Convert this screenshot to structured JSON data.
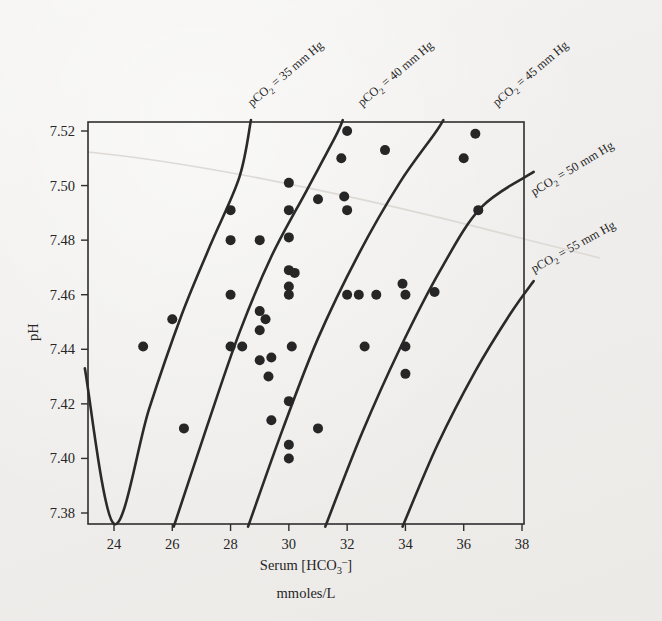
{
  "figure": {
    "background_color": "#f1efec",
    "ink_color": "#262626",
    "crease_color": "#ddd9d4"
  },
  "axes": {
    "x_title_line1": "Serum [HCO",
    "x_title_sub": "3",
    "x_title_sup": "–",
    "x_title_close": "]",
    "x_title_full": "Serum [HCO₃⁻]",
    "x_title_line2": "mmoles/L",
    "y_title": "pH",
    "x_ticks": [
      "24",
      "26",
      "28",
      "30",
      "32",
      "34",
      "36",
      "38"
    ],
    "y_ticks": [
      "7.38",
      "7.40",
      "7.42",
      "7.44",
      "7.46",
      "7.48",
      "7.50",
      "7.52"
    ]
  },
  "isopleths": [
    {
      "label_prefix": "pCO",
      "label_sub": "2",
      "label_suffix": " = 35 mm Hg",
      "value": 35,
      "label_text": "pCO₂ = 35 mm Hg"
    },
    {
      "label_prefix": "pCO",
      "label_sub": "2",
      "label_suffix": " = 40 mm Hg",
      "value": 40,
      "label_text": "pCO₂ = 40 mm Hg"
    },
    {
      "label_prefix": "pCO",
      "label_sub": "2",
      "label_suffix": " = 45 mm Hg",
      "value": 45,
      "label_text": "pCO₂ = 45 mm Hg"
    },
    {
      "label_prefix": "pCO",
      "label_sub": "2",
      "label_suffix": " = 50 mm Hg",
      "value": 50,
      "label_text": "pCO₂ = 50 mm Hg"
    },
    {
      "label_prefix": "pCO",
      "label_sub": "2",
      "label_suffix": " = 55 mm Hg",
      "value": 55,
      "label_text": "pCO₂ = 55 mm Hg"
    }
  ],
  "chart_data": {
    "type": "scatter",
    "title": "",
    "xlabel": "Serum [HCO₃⁻] mmoles/L",
    "ylabel": "pH",
    "xlim": [
      23,
      38.4
    ],
    "ylim": [
      7.371,
      7.525
    ],
    "grid": false,
    "legend": "none",
    "x_tick_values": [
      24,
      26,
      28,
      30,
      32,
      34,
      36,
      38
    ],
    "y_tick_values": [
      7.38,
      7.4,
      7.42,
      7.44,
      7.46,
      7.48,
      7.5,
      7.52
    ],
    "points": [
      [
        25.0,
        7.441
      ],
      [
        26.0,
        7.451
      ],
      [
        26.4,
        7.411
      ],
      [
        28.0,
        7.491
      ],
      [
        28.0,
        7.48
      ],
      [
        28.0,
        7.46
      ],
      [
        28.0,
        7.441
      ],
      [
        28.4,
        7.441
      ],
      [
        29.0,
        7.48
      ],
      [
        29.0,
        7.454
      ],
      [
        29.2,
        7.451
      ],
      [
        29.0,
        7.447
      ],
      [
        29.0,
        7.436
      ],
      [
        29.3,
        7.43
      ],
      [
        29.4,
        7.437
      ],
      [
        29.4,
        7.414
      ],
      [
        30.0,
        7.501
      ],
      [
        30.0,
        7.491
      ],
      [
        30.0,
        7.481
      ],
      [
        30.0,
        7.469
      ],
      [
        30.2,
        7.468
      ],
      [
        30.0,
        7.463
      ],
      [
        30.0,
        7.46
      ],
      [
        30.1,
        7.441
      ],
      [
        30.0,
        7.421
      ],
      [
        30.0,
        7.405
      ],
      [
        30.0,
        7.4
      ],
      [
        31.0,
        7.495
      ],
      [
        31.0,
        7.411
      ],
      [
        31.8,
        7.51
      ],
      [
        31.9,
        7.496
      ],
      [
        32.0,
        7.52
      ],
      [
        32.0,
        7.491
      ],
      [
        32.0,
        7.46
      ],
      [
        32.4,
        7.46
      ],
      [
        32.6,
        7.441
      ],
      [
        33.0,
        7.46
      ],
      [
        33.3,
        7.513
      ],
      [
        33.9,
        7.464
      ],
      [
        34.0,
        7.46
      ],
      [
        34.0,
        7.441
      ],
      [
        34.0,
        7.431
      ],
      [
        35.0,
        7.461
      ],
      [
        36.0,
        7.51
      ],
      [
        36.4,
        7.519
      ],
      [
        36.5,
        7.491
      ]
    ],
    "isopleth_curves": [
      {
        "name": "pCO2 = 35 mm Hg",
        "value": 35,
        "path_points": [
          [
            23.0,
            7.433
          ],
          [
            24.0,
            7.376
          ],
          [
            25.2,
            7.418
          ],
          [
            26.3,
            7.452
          ],
          [
            27.3,
            7.478
          ],
          [
            28.3,
            7.503
          ],
          [
            28.7,
            7.524
          ]
        ]
      },
      {
        "name": "pCO2 = 40 mm Hg",
        "value": 40,
        "path_points": [
          [
            26.05,
            7.375
          ],
          [
            27.2,
            7.412
          ],
          [
            28.3,
            7.446
          ],
          [
            29.4,
            7.474
          ],
          [
            30.6,
            7.498
          ],
          [
            31.6,
            7.518
          ],
          [
            31.85,
            7.524
          ]
        ]
      },
      {
        "name": "pCO2 = 45 mm Hg",
        "value": 45,
        "path_points": [
          [
            28.6,
            7.375
          ],
          [
            29.8,
            7.411
          ],
          [
            31.0,
            7.444
          ],
          [
            32.4,
            7.475
          ],
          [
            33.8,
            7.501
          ],
          [
            35.0,
            7.519
          ],
          [
            35.3,
            7.524
          ]
        ]
      },
      {
        "name": "pCO2 = 50 mm Hg",
        "value": 50,
        "path_points": [
          [
            31.25,
            7.375
          ],
          [
            32.5,
            7.409
          ],
          [
            33.8,
            7.44
          ],
          [
            35.2,
            7.469
          ],
          [
            36.6,
            7.492
          ],
          [
            38.4,
            7.505
          ]
        ]
      },
      {
        "name": "pCO2 = 55 mm Hg",
        "value": 55,
        "path_points": [
          [
            33.9,
            7.375
          ],
          [
            35.1,
            7.405
          ],
          [
            36.4,
            7.432
          ],
          [
            37.6,
            7.453
          ],
          [
            38.4,
            7.465
          ]
        ]
      }
    ]
  }
}
